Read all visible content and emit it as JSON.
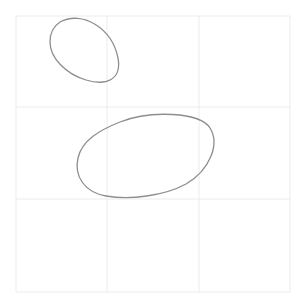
{
  "image": {
    "description": "Pencil sketch of two ovals on a 3x3 faint grid",
    "background": "#ffffff",
    "grid_color": "#ececec",
    "stroke_color": "#8e8e8e"
  },
  "grid": {
    "left": 16,
    "top": 16,
    "right": 290,
    "bottom": 292,
    "v_lines": [
      107,
      199
    ],
    "h_lines": [
      107,
      199
    ]
  },
  "shapes": [
    {
      "name": "small-oval",
      "path": "M 60 22 C 82 10, 112 28, 118 58 C 122 80, 106 86, 86 80 C 66 74, 50 58, 50 42 C 50 32, 54 26, 60 22 Z"
    },
    {
      "name": "large-oval",
      "path": "M 120 122 C 150 110, 200 112, 210 128 C 220 144, 210 170, 186 184 C 164 196, 130 200, 106 196 C 84 192, 74 176, 78 158 C 82 140, 100 130, 120 122 Z"
    }
  ]
}
